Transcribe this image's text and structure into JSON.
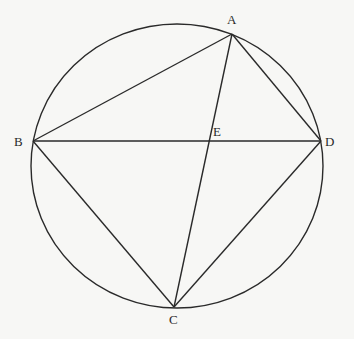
{
  "diagram": {
    "type": "geometry-circle-inscribed-quadrilateral",
    "colors": {
      "stroke": "#2a2a2a",
      "background": "#f7f7f5"
    },
    "circle": {
      "cx": 177,
      "cy": 166,
      "rx": 146,
      "ry": 142
    },
    "points": {
      "A": {
        "label": "A",
        "x": 232,
        "y": 34,
        "lx": 227,
        "ly": 24
      },
      "B": {
        "label": "B",
        "x": 33,
        "y": 141,
        "lx": 14,
        "ly": 146
      },
      "C": {
        "label": "C",
        "x": 174,
        "y": 307,
        "lx": 169,
        "ly": 324
      },
      "D": {
        "label": "D",
        "x": 321,
        "y": 141,
        "lx": 325,
        "ly": 146
      },
      "E": {
        "label": "E",
        "x": 209,
        "y": 141,
        "lx": 213,
        "ly": 136
      }
    },
    "segments": [
      "AB",
      "AD",
      "AC",
      "BD",
      "BC",
      "CD"
    ]
  }
}
